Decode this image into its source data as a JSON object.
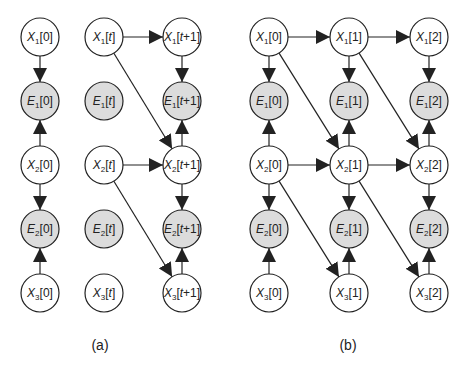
{
  "colors": {
    "observed_fill": "#dcdcdc",
    "hidden_fill": "#ffffff",
    "stroke": "#222222"
  },
  "panels": [
    {
      "caption": "(a)",
      "caption_pos": [
        100,
        350
      ],
      "nodes": [
        {
          "id": "a_X1_0",
          "var": "X",
          "sub": "1",
          "idx": "[0]",
          "x": 40,
          "y": 37,
          "observed": false
        },
        {
          "id": "a_E1_0",
          "var": "E",
          "sub": "1",
          "idx": "[0]",
          "x": 40,
          "y": 101,
          "observed": true
        },
        {
          "id": "a_X2_0",
          "var": "X",
          "sub": "2",
          "idx": "[0]",
          "x": 40,
          "y": 165,
          "observed": false
        },
        {
          "id": "a_E2_0",
          "var": "E",
          "sub": "2",
          "idx": "[0]",
          "x": 40,
          "y": 229,
          "observed": true
        },
        {
          "id": "a_X3_0",
          "var": "X",
          "sub": "3",
          "idx": "[0]",
          "x": 40,
          "y": 293,
          "observed": false
        },
        {
          "id": "a_X1_t",
          "var": "X",
          "sub": "1",
          "idx": "[t]",
          "x": 104,
          "y": 37,
          "observed": false
        },
        {
          "id": "a_E1_t",
          "var": "E",
          "sub": "1",
          "idx": "[t]",
          "x": 104,
          "y": 101,
          "observed": true
        },
        {
          "id": "a_X2_t",
          "var": "X",
          "sub": "2",
          "idx": "[t]",
          "x": 104,
          "y": 165,
          "observed": false
        },
        {
          "id": "a_E2_t",
          "var": "E",
          "sub": "2",
          "idx": "[t]",
          "x": 104,
          "y": 229,
          "observed": true
        },
        {
          "id": "a_X3_t",
          "var": "X",
          "sub": "3",
          "idx": "[t]",
          "x": 104,
          "y": 293,
          "observed": false
        },
        {
          "id": "a_X1_t1",
          "var": "X",
          "sub": "1",
          "idx": "[t+1]",
          "x": 182,
          "y": 37,
          "observed": false
        },
        {
          "id": "a_E1_t1",
          "var": "E",
          "sub": "1",
          "idx": "[t+1]",
          "x": 182,
          "y": 101,
          "observed": true
        },
        {
          "id": "a_X2_t1",
          "var": "X",
          "sub": "2",
          "idx": "[t+1]",
          "x": 182,
          "y": 165,
          "observed": false
        },
        {
          "id": "a_E2_t1",
          "var": "E",
          "sub": "2",
          "idx": "[t+1]",
          "x": 182,
          "y": 229,
          "observed": true
        },
        {
          "id": "a_X3_t1",
          "var": "X",
          "sub": "3",
          "idx": "[t+1]",
          "x": 182,
          "y": 293,
          "observed": false
        }
      ],
      "edges": [
        [
          "a_X1_0",
          "a_E1_0"
        ],
        [
          "a_X2_0",
          "a_E1_0"
        ],
        [
          "a_X2_0",
          "a_E2_0"
        ],
        [
          "a_X3_0",
          "a_E2_0"
        ],
        [
          "a_X1_t",
          "a_X1_t1"
        ],
        [
          "a_X1_t",
          "a_X2_t1"
        ],
        [
          "a_X2_t",
          "a_X2_t1"
        ],
        [
          "a_X2_t",
          "a_X3_t1"
        ],
        [
          "a_X1_t1",
          "a_E1_t1"
        ],
        [
          "a_X2_t1",
          "a_E1_t1"
        ],
        [
          "a_X2_t1",
          "a_E2_t1"
        ],
        [
          "a_X3_t1",
          "a_E2_t1"
        ]
      ]
    },
    {
      "caption": "(b)",
      "caption_pos": [
        348,
        350
      ],
      "nodes": [
        {
          "id": "b_X1_0",
          "var": "X",
          "sub": "1",
          "idx": "[0]",
          "x": 269,
          "y": 37,
          "observed": false
        },
        {
          "id": "b_E1_0",
          "var": "E",
          "sub": "1",
          "idx": "[0]",
          "x": 269,
          "y": 101,
          "observed": true
        },
        {
          "id": "b_X2_0",
          "var": "X",
          "sub": "2",
          "idx": "[0]",
          "x": 269,
          "y": 165,
          "observed": false
        },
        {
          "id": "b_E2_0",
          "var": "E",
          "sub": "2",
          "idx": "[0]",
          "x": 269,
          "y": 229,
          "observed": true
        },
        {
          "id": "b_X3_0",
          "var": "X",
          "sub": "3",
          "idx": "[0]",
          "x": 269,
          "y": 293,
          "observed": false
        },
        {
          "id": "b_X1_1",
          "var": "X",
          "sub": "1",
          "idx": "[1]",
          "x": 349,
          "y": 37,
          "observed": false
        },
        {
          "id": "b_E1_1",
          "var": "E",
          "sub": "1",
          "idx": "[1]",
          "x": 349,
          "y": 101,
          "observed": true
        },
        {
          "id": "b_X2_1",
          "var": "X",
          "sub": "2",
          "idx": "[1]",
          "x": 349,
          "y": 165,
          "observed": false
        },
        {
          "id": "b_E2_1",
          "var": "E",
          "sub": "2",
          "idx": "[1]",
          "x": 349,
          "y": 229,
          "observed": true
        },
        {
          "id": "b_X3_1",
          "var": "X",
          "sub": "3",
          "idx": "[1]",
          "x": 349,
          "y": 293,
          "observed": false
        },
        {
          "id": "b_X1_2",
          "var": "X",
          "sub": "1",
          "idx": "[2]",
          "x": 429,
          "y": 37,
          "observed": false
        },
        {
          "id": "b_E1_2",
          "var": "E",
          "sub": "1",
          "idx": "[2]",
          "x": 429,
          "y": 101,
          "observed": true
        },
        {
          "id": "b_X2_2",
          "var": "X",
          "sub": "2",
          "idx": "[2]",
          "x": 429,
          "y": 165,
          "observed": false
        },
        {
          "id": "b_E2_2",
          "var": "E",
          "sub": "2",
          "idx": "[2]",
          "x": 429,
          "y": 229,
          "observed": true
        },
        {
          "id": "b_X3_2",
          "var": "X",
          "sub": "3",
          "idx": "[2]",
          "x": 429,
          "y": 293,
          "observed": false
        }
      ],
      "edges": [
        [
          "b_X1_0",
          "b_E1_0"
        ],
        [
          "b_X2_0",
          "b_E1_0"
        ],
        [
          "b_X2_0",
          "b_E2_0"
        ],
        [
          "b_X3_0",
          "b_E2_0"
        ],
        [
          "b_X1_1",
          "b_E1_1"
        ],
        [
          "b_X2_1",
          "b_E1_1"
        ],
        [
          "b_X2_1",
          "b_E2_1"
        ],
        [
          "b_X3_1",
          "b_E2_1"
        ],
        [
          "b_X1_2",
          "b_E1_2"
        ],
        [
          "b_X2_2",
          "b_E1_2"
        ],
        [
          "b_X2_2",
          "b_E2_2"
        ],
        [
          "b_X3_2",
          "b_E2_2"
        ],
        [
          "b_X1_0",
          "b_X1_1"
        ],
        [
          "b_X1_1",
          "b_X1_2"
        ],
        [
          "b_X2_0",
          "b_X2_1"
        ],
        [
          "b_X2_1",
          "b_X2_2"
        ],
        [
          "b_X1_0",
          "b_X2_1"
        ],
        [
          "b_X1_1",
          "b_X2_2"
        ],
        [
          "b_X2_0",
          "b_X3_1"
        ],
        [
          "b_X2_1",
          "b_X3_2"
        ]
      ]
    }
  ]
}
